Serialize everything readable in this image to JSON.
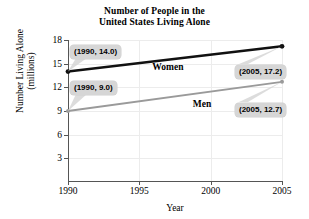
{
  "chart_data": {
    "type": "line",
    "title": "Number of People in the United States Living Alone",
    "title_lines": [
      "Number of People in the",
      "United States Living Alone"
    ],
    "xlabel": "Year",
    "ylabel": "Number Living Alone (millions)",
    "ylabel_lines": [
      "Number Living Alone",
      "(millions)"
    ],
    "x": [
      1990,
      2005
    ],
    "xlim": [
      1990,
      2005
    ],
    "ylim": [
      0,
      18
    ],
    "xticks": [
      1990,
      1995,
      2000,
      2005
    ],
    "xtick_labels": [
      "1990",
      "1995",
      "2000",
      "2005"
    ],
    "yticks": [
      3,
      6,
      9,
      12,
      15,
      18
    ],
    "ytick_labels": [
      "3",
      "6",
      "9",
      "12",
      "15",
      "18"
    ],
    "grid": true,
    "legend": "inline-labels",
    "series": [
      {
        "name": "Women",
        "color": "#111111",
        "values": [
          14.0,
          17.2
        ],
        "points": [
          {
            "x": 1990,
            "y": 14.0
          },
          {
            "x": 2005,
            "y": 17.2
          }
        ]
      },
      {
        "name": "Men",
        "color": "#9a9a9a",
        "values": [
          9.0,
          12.7
        ],
        "points": [
          {
            "x": 1990,
            "y": 9.0
          },
          {
            "x": 2005,
            "y": 12.7
          }
        ]
      }
    ],
    "annotations": [
      {
        "text": "(1990, 14.0)",
        "series": "Women",
        "point": {
          "x": 1990,
          "y": 14.0
        }
      },
      {
        "text": "(1990, 9.0)",
        "series": "Men",
        "point": {
          "x": 1990,
          "y": 9.0
        }
      },
      {
        "text": "(2005, 17.2)",
        "series": "Women",
        "point": {
          "x": 2005,
          "y": 17.2
        }
      },
      {
        "text": "(2005, 12.7)",
        "series": "Men",
        "point": {
          "x": 2005,
          "y": 12.7
        }
      }
    ],
    "colors": {
      "women_line": "#111111",
      "men_line": "#9a9a9a",
      "callout_bg": "#d6d6d6",
      "grid": "#ececec",
      "axis": "#555555",
      "background": "#ffffff"
    }
  }
}
